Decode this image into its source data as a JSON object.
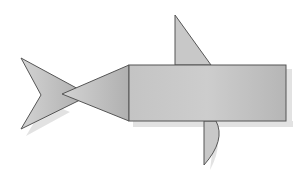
{
  "figure": {
    "colors": {
      "background": "#ffffff",
      "fill_light": "#cfcfcf",
      "fill_dark": "#a9a9a9",
      "stroke": "#4a4a4a",
      "shadow": "#d8d8d8"
    },
    "shapes": [
      {
        "name": "tail",
        "type": "chevron"
      },
      {
        "name": "head",
        "type": "triangle"
      },
      {
        "name": "body",
        "type": "rectangle"
      },
      {
        "name": "top-fin",
        "type": "right-triangle"
      },
      {
        "name": "bottom-fin",
        "type": "curved-fin"
      }
    ]
  }
}
